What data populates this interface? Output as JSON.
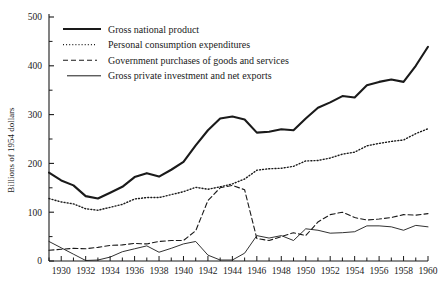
{
  "chart_data": {
    "type": "line",
    "title": "",
    "xlabel": "",
    "ylabel": "Billions of 1954 dollars",
    "xlim": [
      1929,
      1960
    ],
    "ylim": [
      0,
      500
    ],
    "ytick_labels": [
      "0",
      "100",
      "200",
      "300",
      "400",
      "500"
    ],
    "yticks": [
      0,
      100,
      200,
      300,
      400,
      500
    ],
    "yminor_step": 50,
    "xtick_labels": [
      "1930",
      "1932",
      "1934",
      "1936",
      "1938",
      "1940",
      "1942",
      "1944",
      "1946",
      "1948",
      "1950",
      "1952",
      "1954",
      "1956",
      "1958",
      "1960"
    ],
    "xticks": [
      1930,
      1932,
      1934,
      1936,
      1938,
      1940,
      1942,
      1944,
      1946,
      1948,
      1950,
      1952,
      1954,
      1956,
      1958,
      1960
    ],
    "xminor_step": 1,
    "grid": false,
    "legend_position": "top-left",
    "x": [
      1929,
      1930,
      1931,
      1932,
      1933,
      1934,
      1935,
      1936,
      1937,
      1938,
      1939,
      1940,
      1941,
      1942,
      1943,
      1944,
      1945,
      1946,
      1947,
      1948,
      1949,
      1950,
      1951,
      1952,
      1953,
      1954,
      1955,
      1956,
      1957,
      1958,
      1959,
      1960
    ],
    "series": [
      {
        "name": "Gross national product",
        "style": "solid-thick",
        "color": "#1a1a1a",
        "values": [
          181,
          165,
          155,
          133,
          128,
          140,
          152,
          172,
          180,
          173,
          187,
          203,
          237,
          268,
          292,
          296,
          290,
          263,
          265,
          270,
          268,
          292,
          314,
          325,
          338,
          335,
          360,
          367,
          372,
          367,
          400,
          439
        ]
      },
      {
        "name": "Personal consumption expenditures",
        "style": "dotted",
        "color": "#1a1a1a",
        "values": [
          128,
          121,
          117,
          107,
          104,
          110,
          116,
          127,
          130,
          130,
          136,
          142,
          151,
          147,
          152,
          158,
          168,
          186,
          189,
          190,
          194,
          205,
          206,
          211,
          219,
          223,
          236,
          241,
          245,
          248,
          261,
          271
        ]
      },
      {
        "name": "Government purchases of goods and services",
        "style": "dashed",
        "color": "#1a1a1a",
        "values": [
          22,
          24,
          26,
          25,
          28,
          32,
          33,
          36,
          35,
          40,
          42,
          42,
          62,
          124,
          150,
          155,
          146,
          46,
          42,
          50,
          58,
          52,
          80,
          95,
          100,
          89,
          84,
          86,
          89,
          95,
          94,
          97
        ]
      },
      {
        "name": "Gross private investment and net exports",
        "style": "solid-thin",
        "color": "#1a1a1a",
        "values": [
          40,
          27,
          14,
          1,
          2,
          8,
          19,
          25,
          31,
          18,
          26,
          35,
          40,
          12,
          2,
          2,
          16,
          52,
          47,
          52,
          42,
          66,
          63,
          57,
          58,
          60,
          72,
          72,
          70,
          63,
          73,
          70
        ]
      }
    ]
  },
  "legend": {
    "items": [
      {
        "label": "Gross national product",
        "style": "solid-thick"
      },
      {
        "label": "Personal consumption expenditures",
        "style": "dotted"
      },
      {
        "label": "Government purchases of goods and services",
        "style": "dashed"
      },
      {
        "label": "Gross private investment and net exports",
        "style": "solid-thin"
      }
    ]
  }
}
